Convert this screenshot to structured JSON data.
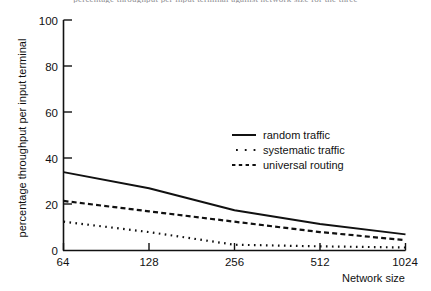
{
  "figure": {
    "title_sliver": "percentage throughput per input terminal against network size for the three",
    "background_color": "#ffffff",
    "ink_color": "#111111"
  },
  "chart_data": {
    "type": "line",
    "title": "",
    "subtitle": "",
    "xlabel": "Network size",
    "ylabel": "percentage throughput per input terminal",
    "x": [
      64,
      128,
      256,
      512,
      1024
    ],
    "x_tick_labels": [
      "64",
      "128",
      "256",
      "512",
      "1024"
    ],
    "x_scale": "log2-evenly-spaced",
    "xlim": [
      64,
      1024
    ],
    "ylim": [
      0,
      100
    ],
    "y_ticks": [
      0,
      20,
      40,
      60,
      80,
      100
    ],
    "y_tick_labels": [
      "0",
      "20",
      "40",
      "60",
      "80",
      "100"
    ],
    "grid": false,
    "legend_position": "center-right-inside",
    "series": [
      {
        "name": "random traffic",
        "style": "solid",
        "color": "#111111",
        "values": [
          34,
          27,
          17.5,
          11.5,
          7
        ]
      },
      {
        "name": "systematic traffic",
        "style": "dotted",
        "color": "#111111",
        "values": [
          12.5,
          8,
          2.5,
          1.8,
          1.3
        ]
      },
      {
        "name": "universal routing",
        "style": "dashed",
        "color": "#111111",
        "values": [
          21.5,
          17,
          12.5,
          8,
          4.5
        ]
      }
    ]
  },
  "legend": {
    "entries": [
      {
        "label": "random traffic",
        "style": "solid"
      },
      {
        "label": "systematic traffic",
        "style": "dotted"
      },
      {
        "label": "universal routing",
        "style": "dashed"
      }
    ]
  },
  "axes": {
    "y_title": "percentage throughput per input terminal",
    "x_title": "Network size",
    "y_tick_0": "0",
    "y_tick_20": "20",
    "y_tick_40": "40",
    "y_tick_60": "60",
    "y_tick_80": "80",
    "y_tick_100": "100",
    "x_tick_64": "64",
    "x_tick_128": "128",
    "x_tick_256": "256",
    "x_tick_512": "512",
    "x_tick_1024": "1024"
  }
}
